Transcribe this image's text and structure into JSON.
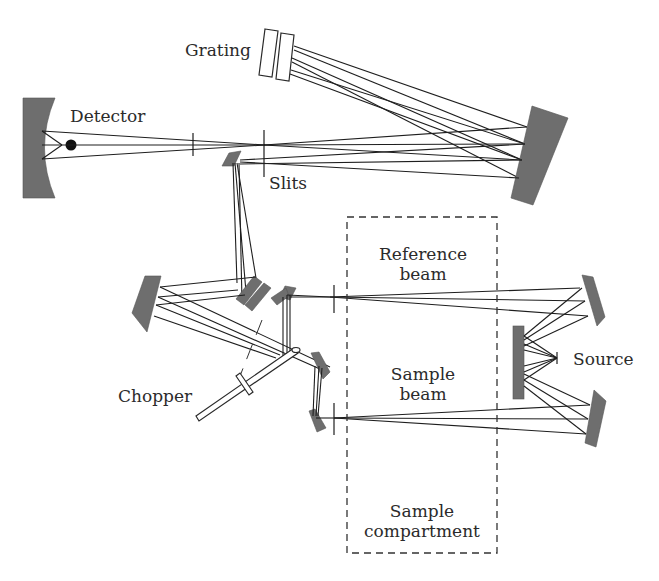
{
  "diagram": {
    "labels": {
      "grating": "Grating",
      "detector": "Detector",
      "slits": "Slits",
      "reference_beam_line1": "Reference",
      "reference_beam_line2": "beam",
      "sample_beam_line1": "Sample",
      "sample_beam_line2": "beam",
      "source": "Source",
      "chopper": "Chopper",
      "sample_compartment_line1": "Sample",
      "sample_compartment_line2": "compartment"
    },
    "components": [
      {
        "id": "detector",
        "type": "concave-mirror"
      },
      {
        "id": "grating",
        "type": "double-plate"
      },
      {
        "id": "collimating-mirror",
        "type": "mirror"
      },
      {
        "id": "entrance-slit",
        "type": "slit"
      },
      {
        "id": "exit-slit",
        "type": "slit"
      },
      {
        "id": "fold-mirror",
        "type": "mirror"
      },
      {
        "id": "chopper",
        "type": "rotating-mirror"
      },
      {
        "id": "sample-compartment",
        "type": "dashed-box"
      },
      {
        "id": "source",
        "type": "lamp"
      },
      {
        "id": "source-mirrors",
        "type": "mirror-array"
      }
    ],
    "colors": {
      "mirror_fill": "#6e6e6e",
      "ray": "#1e1e1e",
      "text": "#2b2b2b",
      "background": "#ffffff"
    }
  }
}
